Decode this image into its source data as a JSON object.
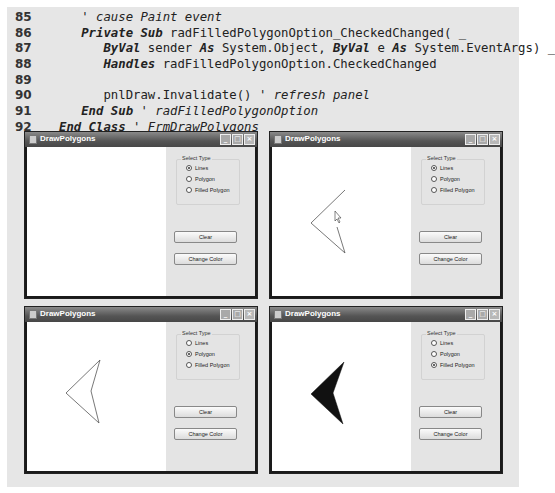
{
  "code": {
    "lines": [
      {
        "num": "85",
        "segments": [
          {
            "t": "   ",
            "s": ""
          },
          {
            "t": "' cause Paint event",
            "s": "cm"
          }
        ]
      },
      {
        "num": "86",
        "segments": [
          {
            "t": "   ",
            "s": ""
          },
          {
            "t": "Private Sub",
            "s": "kw"
          },
          {
            "t": " radFilledPolygonOption_CheckedChanged( _",
            "s": ""
          }
        ]
      },
      {
        "num": "87",
        "segments": [
          {
            "t": "      ",
            "s": ""
          },
          {
            "t": "ByVal",
            "s": "kw"
          },
          {
            "t": " sender ",
            "s": ""
          },
          {
            "t": "As",
            "s": "kw"
          },
          {
            "t": " System.Object, ",
            "s": ""
          },
          {
            "t": "ByVal",
            "s": "kw"
          },
          {
            "t": " e ",
            "s": ""
          },
          {
            "t": "As",
            "s": "kw"
          },
          {
            "t": " System.EventArgs) _",
            "s": ""
          }
        ]
      },
      {
        "num": "88",
        "segments": [
          {
            "t": "      ",
            "s": ""
          },
          {
            "t": "Handles",
            "s": "kw"
          },
          {
            "t": " radFilledPolygonOption.CheckedChanged",
            "s": ""
          }
        ]
      },
      {
        "num": "89",
        "segments": []
      },
      {
        "num": "90",
        "segments": [
          {
            "t": "      pnlDraw.Invalidate() ",
            "s": ""
          },
          {
            "t": "' refresh panel",
            "s": "cm"
          }
        ]
      },
      {
        "num": "91",
        "segments": [
          {
            "t": "   ",
            "s": ""
          },
          {
            "t": "End Sub",
            "s": "kw"
          },
          {
            "t": " ",
            "s": ""
          },
          {
            "t": "' radFilledPolygonOption",
            "s": "cm"
          }
        ]
      },
      {
        "num": "92",
        "segments": [
          {
            "t": "End Class",
            "s": "kw"
          },
          {
            "t": " ",
            "s": ""
          },
          {
            "t": "' FrmDrawPolygons",
            "s": "cm"
          }
        ]
      }
    ]
  },
  "windows": [
    {
      "title": "DrawPolygons",
      "group_label": "Select Type",
      "options": [
        "Lines",
        "Polygon",
        "Filled Polygon"
      ],
      "selected": 0,
      "clear_label": "Clear",
      "color_label": "Change Color",
      "shape": {
        "type": "none",
        "points": []
      }
    },
    {
      "title": "DrawPolygons",
      "group_label": "Select Type",
      "options": [
        "Lines",
        "Polygon",
        "Filled Polygon"
      ],
      "selected": 0,
      "clear_label": "Clear",
      "color_label": "Change Color",
      "shape": {
        "type": "lines",
        "points": [
          [
            73,
            43
          ],
          [
            39,
            76
          ],
          [
            73,
            106
          ],
          [
            65,
            80
          ]
        ]
      }
    },
    {
      "title": "DrawPolygons",
      "group_label": "Select Type",
      "options": [
        "Lines",
        "Polygon",
        "Filled Polygon"
      ],
      "selected": 1,
      "clear_label": "Clear",
      "color_label": "Change Color",
      "shape": {
        "type": "polygon",
        "points": [
          [
            73,
            38
          ],
          [
            39,
            71
          ],
          [
            72,
            101
          ],
          [
            64,
            69
          ]
        ]
      }
    },
    {
      "title": "DrawPolygons",
      "group_label": "Select Type",
      "options": [
        "Lines",
        "Polygon",
        "Filled Polygon"
      ],
      "selected": 2,
      "clear_label": "Clear",
      "color_label": "Change Color",
      "shape": {
        "type": "filled",
        "points": [
          [
            72,
            40
          ],
          [
            39,
            72
          ],
          [
            71,
            102
          ],
          [
            61,
            71
          ]
        ]
      }
    }
  ],
  "titlebar_buttons": {
    "minimize": "_",
    "maximize": "□",
    "close": "×"
  }
}
